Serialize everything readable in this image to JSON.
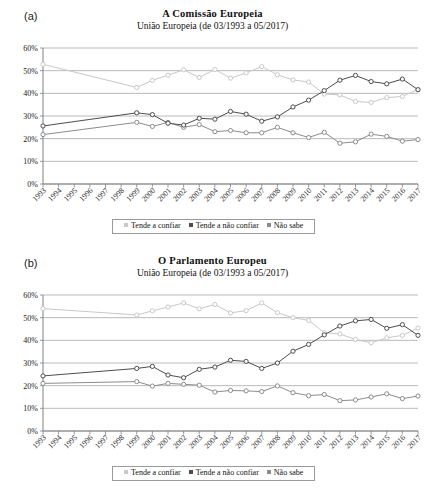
{
  "figure": {
    "panels": [
      {
        "letter": "(a)",
        "title": "A Comissão Europeia",
        "subtitle": "União Europeia (de 03/1993 a 05/2017)"
      },
      {
        "letter": "(b)",
        "title": "O Parlamento Europeu",
        "subtitle": "União Europeia (de 03/1993 a 05/2017)"
      }
    ],
    "legend": {
      "items": [
        {
          "label": "Tende a confiar",
          "color": "#c9c9c9"
        },
        {
          "label": "Tende a não confiar",
          "color": "#4d4d4d"
        },
        {
          "label": "Não sabe",
          "color": "#8c8c8c"
        }
      ]
    },
    "colors": {
      "trust": "#c9c9c9",
      "distrust": "#4d4d4d",
      "dontknow": "#8c8c8c",
      "grid": "#b3b3b3",
      "axis": "#808080",
      "text": "#1a1a1a"
    }
  },
  "chart_data": [
    {
      "type": "line",
      "title": "A Comissão Europeia",
      "subtitle": "União Europeia (de 03/1993 a 05/2017)",
      "xlabel": "",
      "ylabel": "",
      "ylim": [
        0,
        60
      ],
      "yticks": [
        0,
        10,
        20,
        30,
        40,
        50,
        60
      ],
      "ytick_labels": [
        "0%",
        "10%",
        "20%",
        "30%",
        "40%",
        "50%",
        "60%"
      ],
      "grid": true,
      "legend_position": "bottom",
      "categories": [
        "1993",
        "1994",
        "1995",
        "1996",
        "1997",
        "1998",
        "1999",
        "2000",
        "2001",
        "2002",
        "2003",
        "2004",
        "2005",
        "2006",
        "2007",
        "2008",
        "2009",
        "2010",
        "2011",
        "2012",
        "2013",
        "2014",
        "2015",
        "2016",
        "2017"
      ],
      "series": [
        {
          "name": "Tende a confiar",
          "color": "#c9c9c9",
          "values": [
            52.8,
            null,
            null,
            null,
            null,
            null,
            42.6,
            45.7,
            48.0,
            50.4,
            47.0,
            50.5,
            46.7,
            49.0,
            51.8,
            48.2,
            45.9,
            45.0,
            39.7,
            39.3,
            36.4,
            36.0,
            38.1,
            38.6,
            41.7
          ]
        },
        {
          "name": "Tende a não confiar",
          "color": "#4d4d4d",
          "values": [
            25.6,
            null,
            null,
            null,
            null,
            null,
            31.4,
            30.6,
            26.8,
            26.0,
            29.0,
            28.6,
            32.0,
            30.8,
            27.7,
            29.6,
            34.0,
            37.0,
            41.2,
            45.8,
            47.9,
            45.2,
            44.2,
            46.3,
            41.6
          ]
        },
        {
          "name": "Não sabe",
          "color": "#8c8c8c",
          "values": [
            21.8,
            null,
            null,
            null,
            null,
            null,
            27.2,
            25.4,
            27.2,
            25.0,
            26.2,
            23.1,
            23.6,
            22.6,
            22.6,
            25.0,
            22.6,
            20.5,
            22.8,
            18.0,
            18.6,
            22.0,
            21.0,
            18.9,
            19.6
          ]
        }
      ]
    },
    {
      "type": "line",
      "title": "O Parlamento Europeu",
      "subtitle": "União Europeia (de 03/1993 a 05/2017)",
      "xlabel": "",
      "ylabel": "",
      "ylim": [
        0,
        60
      ],
      "yticks": [
        0,
        10,
        20,
        30,
        40,
        50,
        60
      ],
      "ytick_labels": [
        "0%",
        "10%",
        "20%",
        "30%",
        "40%",
        "50%",
        "60%"
      ],
      "grid": true,
      "legend_position": "bottom",
      "categories": [
        "1993",
        "1994",
        "1995",
        "1996",
        "1997",
        "1998",
        "1999",
        "2000",
        "2001",
        "2002",
        "2003",
        "2004",
        "2005",
        "2006",
        "2007",
        "2008",
        "2009",
        "2010",
        "2011",
        "2012",
        "2013",
        "2014",
        "2015",
        "2016",
        "2017"
      ],
      "series": [
        {
          "name": "Tende a confiar",
          "color": "#c9c9c9",
          "values": [
            54.0,
            null,
            null,
            null,
            null,
            null,
            51.2,
            53.0,
            54.7,
            56.5,
            53.9,
            55.8,
            52.1,
            53.1,
            56.5,
            52.2,
            50.0,
            48.8,
            43.4,
            42.8,
            40.4,
            38.9,
            41.1,
            42.2,
            45.4
          ]
        },
        {
          "name": "Tende a não confiar",
          "color": "#4d4d4d",
          "values": [
            24.3,
            null,
            null,
            null,
            null,
            null,
            27.6,
            28.5,
            24.7,
            23.5,
            27.2,
            28.2,
            31.2,
            30.7,
            27.6,
            30.0,
            35.2,
            38.2,
            42.4,
            46.3,
            48.6,
            49.2,
            45.3,
            46.9,
            42.2
          ]
        },
        {
          "name": "Não sabe",
          "color": "#8c8c8c",
          "values": [
            21.0,
            null,
            null,
            null,
            null,
            null,
            21.8,
            19.8,
            21.0,
            20.6,
            20.2,
            17.2,
            17.9,
            17.7,
            17.4,
            19.9,
            16.9,
            15.6,
            16.1,
            13.4,
            13.7,
            15.0,
            16.4,
            14.3,
            15.4
          ]
        }
      ]
    }
  ]
}
